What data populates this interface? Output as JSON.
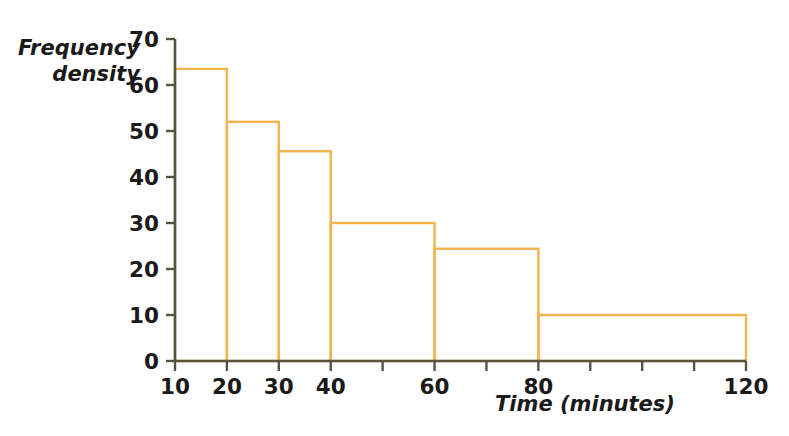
{
  "chart_data": {
    "type": "bar",
    "title": "",
    "subtitle": "",
    "xlabel": "Time (minutes)",
    "ylabel": "Frequency density",
    "ylabel_lines": [
      "Frequency",
      "density"
    ],
    "xlim": [
      10,
      120
    ],
    "ylim": [
      0,
      70
    ],
    "grid": false,
    "legend": null,
    "bar_color": "#F2B44C",
    "bar_fill": "none",
    "axis_color": "#55553f",
    "text_color": "#1a1a1a",
    "x_ticks_labeled": [
      {
        "value": 10,
        "label": "10"
      },
      {
        "value": 20,
        "label": "20"
      },
      {
        "value": 30,
        "label": "30"
      },
      {
        "value": 40,
        "label": "40"
      },
      {
        "value": 60,
        "label": "60"
      },
      {
        "value": 80,
        "label": "80"
      },
      {
        "value": 120,
        "label": "120"
      }
    ],
    "x_ticks_unlabeled": [
      50,
      70,
      90,
      100,
      110
    ],
    "y_ticks": [
      {
        "value": 0,
        "label": "0"
      },
      {
        "value": 10,
        "label": "10"
      },
      {
        "value": 20,
        "label": "20"
      },
      {
        "value": 30,
        "label": "30"
      },
      {
        "value": 40,
        "label": "40"
      },
      {
        "value": 50,
        "label": "50"
      },
      {
        "value": 60,
        "label": "60"
      },
      {
        "value": 70,
        "label": "70"
      }
    ],
    "bins": [
      {
        "x_start": 10,
        "x_end": 20,
        "density": 63.5
      },
      {
        "x_start": 20,
        "x_end": 30,
        "density": 52
      },
      {
        "x_start": 30,
        "x_end": 40,
        "density": 45.6
      },
      {
        "x_start": 40,
        "x_end": 60,
        "density": 30
      },
      {
        "x_start": 60,
        "x_end": 80,
        "density": 24.4
      },
      {
        "x_start": 80,
        "x_end": 120,
        "density": 10
      }
    ]
  }
}
